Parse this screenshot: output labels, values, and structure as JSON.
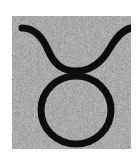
{
  "image": {
    "subject": "Taurus zodiac symbol",
    "glyph": "♉",
    "icon": "taurus-icon",
    "colors": {
      "page_background": "#ffffff",
      "tile_background": "#8f8f8f",
      "noise_light": "#b0b0b0",
      "noise_dark": "#6e6e6e",
      "symbol_stroke": "#111111"
    }
  }
}
